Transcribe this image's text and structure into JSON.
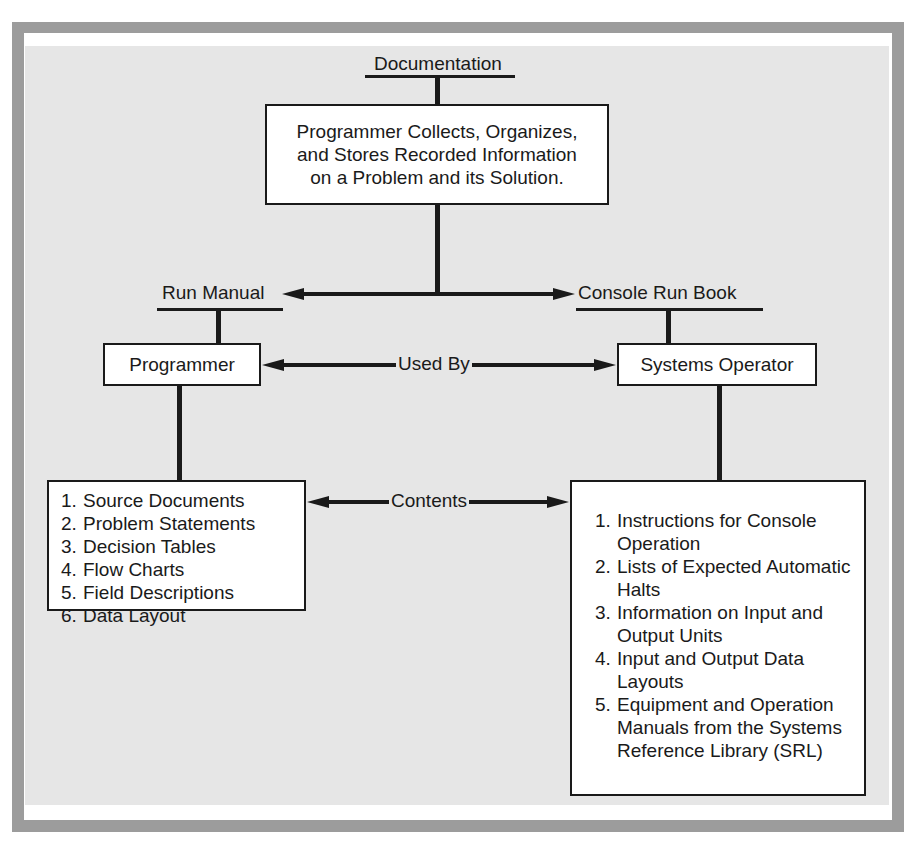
{
  "diagram": {
    "root": {
      "heading": "Documentation",
      "box_lines": [
        "Programmer Collects, Organizes,",
        "and Stores Recorded Information",
        "on a Problem and its Solution."
      ]
    },
    "left_branch": {
      "heading": "Run Manual",
      "role": "Programmer",
      "contents": [
        {
          "num": "1.",
          "text": "Source Documents"
        },
        {
          "num": "2.",
          "text": "Problem Statements"
        },
        {
          "num": "3.",
          "text": "Decision Tables"
        },
        {
          "num": "4.",
          "text": "Flow Charts"
        },
        {
          "num": "5.",
          "text": "Field Descriptions"
        },
        {
          "num": "6.",
          "text": "Data Layout"
        }
      ]
    },
    "right_branch": {
      "heading": "Console Run Book",
      "role": "Systems Operator",
      "contents": [
        {
          "num": "1.",
          "text": "Instructions for Console Operation"
        },
        {
          "num": "2.",
          "text": "Lists of Expected Automatic Halts"
        },
        {
          "num": "3.",
          "text": "Information on Input and Output Units"
        },
        {
          "num": "4.",
          "text": "Input and Output Data Layouts"
        },
        {
          "num": "5.",
          "text": "Equipment and Operation Manuals from the Systems Reference Library (SRL)"
        }
      ]
    },
    "relations": {
      "roles_link": "Used By",
      "contents_link": "Contents"
    },
    "colors": {
      "frame": "#9c9c9c",
      "panel": "#e6e6e6",
      "box": "#ffffff",
      "ink": "#1a1a1a"
    }
  }
}
